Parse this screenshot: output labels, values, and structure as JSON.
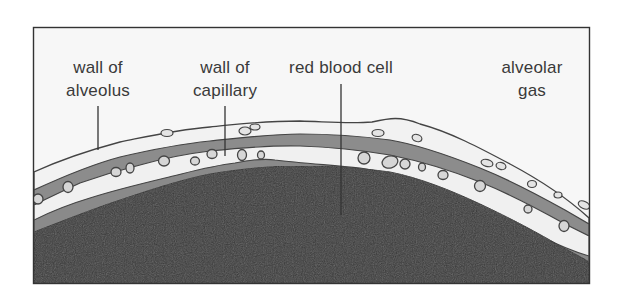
{
  "figure": {
    "type": "cross-section diagram"
  },
  "labels": [
    {
      "id": "wall-of-alveolus",
      "lines": [
        "wall of",
        "alveolus"
      ]
    },
    {
      "id": "wall-of-capillary",
      "lines": [
        "wall of",
        "capillary"
      ]
    },
    {
      "id": "red-blood-cell",
      "lines": [
        "red blood cell"
      ]
    },
    {
      "id": "alveolar-gas",
      "lines": [
        "alveolar",
        "gas"
      ]
    }
  ],
  "colors": {
    "background": "#f7f7f7",
    "frame": "#333333",
    "outer_wall": "#f2f2f2",
    "interstitium": "#8c8c8c",
    "capillary_lumen": "#f0f0f0",
    "lower_layer": "#8a8a8a",
    "tissue": "#3b3b3b",
    "outline": "#444444",
    "text": "#3a3a3a"
  }
}
